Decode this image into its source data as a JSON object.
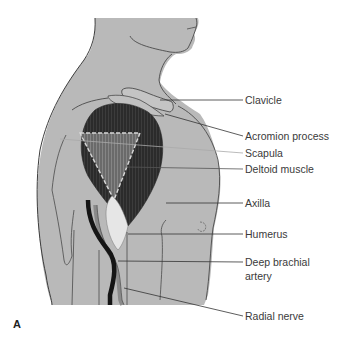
{
  "figure": {
    "panel_letter": "A",
    "colors": {
      "skin": "#b9b9b9",
      "outline": "#4a4a4a",
      "muscle": "#2b2b2b",
      "scapula": "#6e6e6e",
      "tendon": "#e6e6e6",
      "nerve": "#151515",
      "artery": "#8a8a8a",
      "leader": "#333333"
    },
    "labels": [
      {
        "id": "clavicle",
        "text": "Clavicle"
      },
      {
        "id": "acromion-process",
        "text": "Acromion process"
      },
      {
        "id": "scapula",
        "text": "Scapula"
      },
      {
        "id": "deltoid-muscle",
        "text": "Deltoid muscle"
      },
      {
        "id": "axilla",
        "text": "Axilla"
      },
      {
        "id": "humerus",
        "text": "Humerus"
      },
      {
        "id": "deep-brachial-artery",
        "text": "Deep brachial artery",
        "line1": "Deep brachial",
        "line2": "artery"
      },
      {
        "id": "radial-nerve",
        "text": "Radial nerve"
      }
    ]
  }
}
